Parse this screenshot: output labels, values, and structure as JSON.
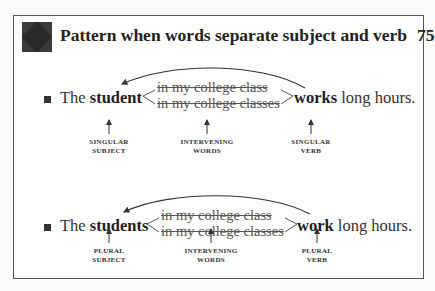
{
  "header": {
    "title": "Pattern when words separate subject and verb",
    "page_number": "75",
    "icon": "diamond-pattern-icon"
  },
  "examples": [
    {
      "lead": "The",
      "subject": "student",
      "intervening": [
        "in my college class",
        "in my college classes"
      ],
      "verb": "works",
      "tail": "long hours.",
      "labels": {
        "subject": [
          "SINGULAR",
          "SUBJECT"
        ],
        "intervening": [
          "INTERVENING",
          "WORDS"
        ],
        "verb": [
          "SINGULAR",
          "VERB"
        ]
      }
    },
    {
      "lead": "The",
      "subject": "students",
      "intervening": [
        "in my college class",
        "in my college classes"
      ],
      "verb": "work",
      "tail": "long hours.",
      "labels": {
        "subject": [
          "PLURAL",
          "SUBJECT"
        ],
        "intervening": [
          "INTERVENING",
          "WORDS"
        ],
        "verb": [
          "PLURAL",
          "VERB"
        ]
      }
    }
  ]
}
